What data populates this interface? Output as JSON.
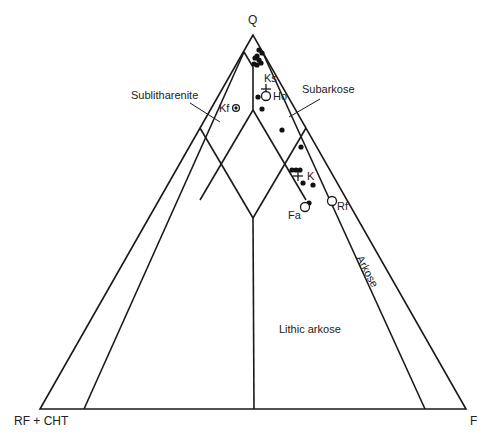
{
  "diagram": {
    "type": "ternary",
    "vertices": {
      "top": "Q",
      "left": "RF + CHT",
      "right": "F"
    },
    "fields": [
      {
        "name": "sublitharenite",
        "label": "Sublitharenite"
      },
      {
        "name": "subarkose",
        "label": "Subarkose"
      },
      {
        "name": "arkose",
        "label": "Arkose"
      },
      {
        "name": "lithic-arkose",
        "label": "Lithic arkose"
      }
    ],
    "samples": [
      {
        "label": "Ks",
        "symbol": "cross"
      },
      {
        "label": "Ho",
        "symbol": "open-circle"
      },
      {
        "label": "Kf",
        "symbol": "dotted-circle"
      },
      {
        "label": "K",
        "symbol": "cross"
      },
      {
        "label": "Fa",
        "symbol": "open-circle"
      },
      {
        "label": "Rf",
        "symbol": "open-circle"
      }
    ],
    "colors": {
      "line": "#1a1a1a",
      "background": "#ffffff"
    }
  }
}
